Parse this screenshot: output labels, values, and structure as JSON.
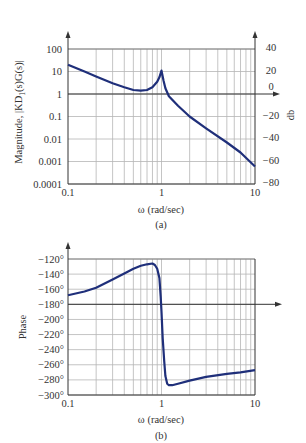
{
  "chart_data": [
    {
      "type": "line",
      "id": "a",
      "caption": "(a)",
      "title": "",
      "xlabel": "ω (rad/sec)",
      "ylabel": "Magnitude, |KD1(s)G(s)|",
      "ylabel_right": "db",
      "xscale": "log",
      "yscale": "log",
      "xlim": [
        0.1,
        10
      ],
      "ylim": [
        0.0001,
        100
      ],
      "x_ticks": [
        "0.1",
        "1",
        "10"
      ],
      "y_ticks": [
        "100",
        "10",
        "1",
        "0.1",
        "0.01",
        "0.001",
        "0.0001"
      ],
      "y_ticks_right": [
        "40",
        "20",
        "0",
        "−20",
        "−40",
        "−60",
        "−80"
      ],
      "grid": true,
      "reference_line": {
        "y": 1,
        "label": "0 dB",
        "arrow": true
      },
      "series": [
        {
          "name": "magnitude",
          "color": "#1f2f7a",
          "x": [
            0.1,
            0.15,
            0.2,
            0.3,
            0.4,
            0.5,
            0.6,
            0.7,
            0.8,
            0.9,
            0.95,
            1.0,
            1.05,
            1.1,
            1.2,
            1.5,
            2,
            3,
            5,
            7,
            10
          ],
          "y": [
            20,
            10,
            6,
            3,
            2,
            1.5,
            1.4,
            1.5,
            2,
            3.5,
            5.5,
            11,
            4,
            1.8,
            0.8,
            0.3,
            0.1,
            0.03,
            0.007,
            0.0025,
            0.0006
          ]
        }
      ]
    },
    {
      "type": "line",
      "id": "b",
      "caption": "(b)",
      "title": "",
      "xlabel": "ω (rad/sec)",
      "ylabel": "Phase",
      "xscale": "log",
      "xlim": [
        0.1,
        10
      ],
      "ylim": [
        -300,
        -120
      ],
      "x_ticks": [
        "0.1",
        "1",
        "10"
      ],
      "y_ticks": [
        "−120°",
        "−140°",
        "−160°",
        "−180°",
        "−200°",
        "−220°",
        "−240°",
        "−260°",
        "−280°",
        "−300°"
      ],
      "grid": true,
      "reference_line": {
        "y": -180,
        "arrow": true
      },
      "series": [
        {
          "name": "phase",
          "color": "#1f2f7a",
          "x": [
            0.1,
            0.15,
            0.2,
            0.3,
            0.4,
            0.5,
            0.6,
            0.7,
            0.8,
            0.85,
            0.9,
            0.95,
            0.98,
            1.0,
            1.03,
            1.07,
            1.1,
            1.15,
            1.2,
            1.3,
            1.5,
            2,
            3,
            5,
            7,
            10
          ],
          "y": [
            -168,
            -163,
            -158,
            -147,
            -139,
            -133,
            -129,
            -127,
            -126,
            -128,
            -133,
            -145,
            -170,
            -190,
            -225,
            -255,
            -275,
            -285,
            -287,
            -287,
            -285,
            -281,
            -276,
            -272,
            -270,
            -267
          ]
        }
      ]
    }
  ],
  "labels": {
    "a": {
      "xlabel": "ω (rad/sec)",
      "ylabel_prefix": "Magnitude, |KD",
      "ylabel_sub": "1",
      "ylabel_suffix": "(s)G(s)|",
      "ylabel_right": "db",
      "caption": "(a)",
      "x_ticks": [
        "0.1",
        "1",
        "10"
      ],
      "y_ticks": [
        "100",
        "10",
        "1",
        "0.1",
        "0.01",
        "0.001",
        "0.0001"
      ],
      "y_ticks_right": [
        "40",
        "20",
        "0",
        "−20",
        "−40",
        "−60",
        "−80"
      ]
    },
    "b": {
      "xlabel": "ω (rad/sec)",
      "ylabel": "Phase",
      "caption": "(b)",
      "x_ticks": [
        "0.1",
        "1",
        "10"
      ],
      "y_ticks": [
        "−120°",
        "−140°",
        "−160°",
        "−180°",
        "−200°",
        "−220°",
        "−240°",
        "−260°",
        "−280°",
        "−300°"
      ]
    }
  },
  "colors": {
    "curve": "#1f2f7a",
    "grid": "#b5b5b5",
    "axis": "#333333"
  }
}
